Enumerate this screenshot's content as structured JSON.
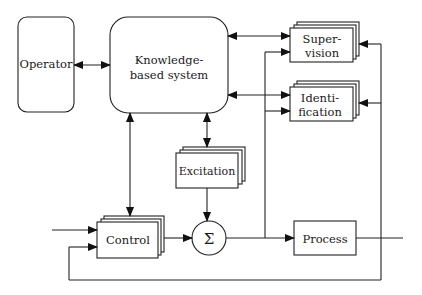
{
  "diagram": {
    "type": "block-diagram",
    "colors": {
      "stroke": "#222222",
      "background": "#ffffff"
    },
    "nodes": {
      "operator": {
        "label": "Operator"
      },
      "kbs": {
        "label_line1": "Knowledge-",
        "label_line2": "based system"
      },
      "supervision": {
        "label_line1": "Super-",
        "label_line2": "vision"
      },
      "identification": {
        "label_line1": "Identi-",
        "label_line2": "fication"
      },
      "excitation": {
        "label": "Excitation"
      },
      "control": {
        "label": "Control"
      },
      "sum": {
        "label": "Σ"
      },
      "process": {
        "label": "Process"
      }
    },
    "edges": [
      {
        "from": "operator",
        "to": "kbs",
        "bidirectional": true
      },
      {
        "from": "kbs",
        "to": "supervision",
        "bidirectional": true
      },
      {
        "from": "kbs",
        "to": "identification",
        "bidirectional": true
      },
      {
        "from": "kbs",
        "to": "excitation",
        "bidirectional": true
      },
      {
        "from": "kbs",
        "to": "control",
        "bidirectional": false
      },
      {
        "from": "excitation",
        "to": "sum",
        "bidirectional": false
      },
      {
        "from": "control",
        "to": "sum",
        "bidirectional": false
      },
      {
        "from": "sum",
        "to": "process",
        "bidirectional": false
      },
      {
        "from": "sum",
        "to": "supervision",
        "bidirectional": false
      },
      {
        "from": "sum",
        "to": "identification",
        "bidirectional": false
      },
      {
        "from": "process-output",
        "to": "supervision",
        "bidirectional": false
      },
      {
        "from": "process-output",
        "to": "identification",
        "bidirectional": false
      },
      {
        "from": "process-output",
        "to": "control",
        "bidirectional": false,
        "note": "feedback"
      },
      {
        "from": "reference-input",
        "to": "control",
        "bidirectional": false
      }
    ]
  }
}
